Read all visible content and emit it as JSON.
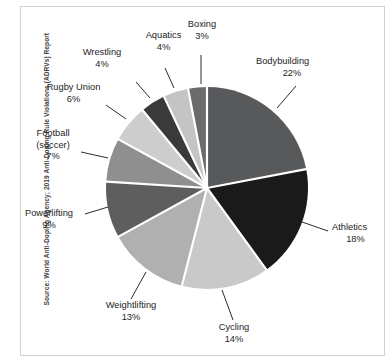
{
  "source_note": "Source: World Anti-Doping Agency; 2019 Anti-Doping Rule Violations (ADRVs) Report",
  "labels": {
    "bodybuilding": {
      "name": "Bodybuilding",
      "pct": "22%"
    },
    "athletics": {
      "name": "Athletics",
      "pct": "18%"
    },
    "cycling": {
      "name": "Cycling",
      "pct": "14%"
    },
    "weightlifting": {
      "name": "Weightlifting",
      "pct": "13%"
    },
    "powerlifting": {
      "name": "Powerlifting",
      "pct": "9%"
    },
    "football_l1": "Football",
    "football_l2": "(soccer)",
    "football_pct": "7%",
    "rugby": {
      "name": "Rugby Union",
      "pct": "6%"
    },
    "wrestling": {
      "name": "Wrestling",
      "pct": "4%"
    },
    "aquatics": {
      "name": "Aquatics",
      "pct": "4%"
    },
    "boxing": {
      "name": "Boxing",
      "pct": "3%"
    }
  },
  "colors": {
    "bodybuilding": "#58595b",
    "athletics": "#1a1a1a",
    "cycling": "#c9c9c9",
    "weightlifting": "#b0b0b0",
    "powerlifting": "#5e5e5e",
    "football": "#8f8f8f",
    "rugby": "#cdcdcd",
    "wrestling": "#3a3a3a",
    "aquatics": "#c4c4c4",
    "boxing": "#6b6b6b",
    "separator": "#ffffff",
    "leader_line": "#2b2b2b",
    "text": "#1d1d1d",
    "border": "#d2d2d2",
    "background": "#ffffff"
  },
  "chart_data": {
    "type": "pie",
    "title": "",
    "subtitle": "",
    "xlabel": "",
    "ylabel": "",
    "legend_position": "none",
    "grid": false,
    "units": "percent of anti-doping rule violations",
    "start_angle_deg": 0,
    "direction": "clockwise",
    "total": 100,
    "categories": [
      "Bodybuilding",
      "Athletics",
      "Cycling",
      "Weightlifting",
      "Powerlifting",
      "Football (soccer)",
      "Rugby Union",
      "Wrestling",
      "Aquatics",
      "Boxing"
    ],
    "values": [
      22,
      18,
      14,
      13,
      9,
      7,
      6,
      4,
      4,
      3
    ],
    "slices": [
      {
        "label": "Bodybuilding",
        "value": 22,
        "display": "22%",
        "color": "#58595b"
      },
      {
        "label": "Athletics",
        "value": 18,
        "display": "18%",
        "color": "#1a1a1a"
      },
      {
        "label": "Cycling",
        "value": 14,
        "display": "14%",
        "color": "#c9c9c9"
      },
      {
        "label": "Weightlifting",
        "value": 13,
        "display": "13%",
        "color": "#b0b0b0"
      },
      {
        "label": "Powerlifting",
        "value": 9,
        "display": "9%",
        "color": "#5e5e5e"
      },
      {
        "label": "Football (soccer)",
        "value": 7,
        "display": "7%",
        "color": "#8f8f8f"
      },
      {
        "label": "Rugby Union",
        "value": 6,
        "display": "6%",
        "color": "#cdcdcd"
      },
      {
        "label": "Wrestling",
        "value": 4,
        "display": "4%",
        "color": "#3a3a3a"
      },
      {
        "label": "Aquatics",
        "value": 4,
        "display": "4%",
        "color": "#c4c4c4"
      },
      {
        "label": "Boxing",
        "value": 3,
        "display": "3%",
        "color": "#6b6b6b"
      }
    ],
    "annotations": [
      "Source: World Anti-Doping Agency; 2019 Anti-Doping Rule Violations (ADRVs) Report"
    ]
  }
}
